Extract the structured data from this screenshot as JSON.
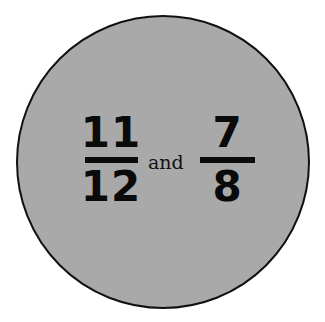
{
  "figure": {
    "fill_color": "#a9a9a9",
    "border_color": "#111111",
    "fractions": [
      {
        "numerator": "11",
        "denominator": "12"
      },
      {
        "numerator": "7",
        "denominator": "8"
      }
    ],
    "connector": "and"
  }
}
